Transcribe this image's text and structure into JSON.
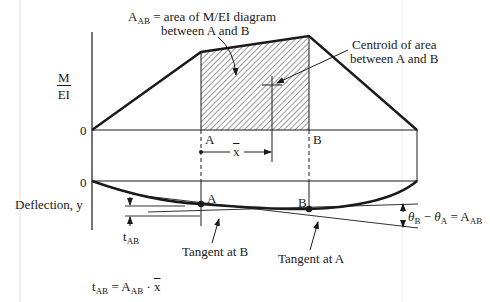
{
  "diagram": {
    "labels": {
      "area_label_main": "A",
      "area_label_sub": "AB",
      "area_label_rest": " = area of M/EI diagram",
      "area_label_line2": "between A and B",
      "centroid_line1": "Centroid of area",
      "centroid_line2": "between A and B",
      "m_ei_num": "M",
      "m_ei_den": "EI",
      "zero_top": "0",
      "zero_bottom": "0",
      "point_a_top": "A",
      "point_b_top": "B",
      "xbar": "x",
      "deflection_axis": "Deflection, y",
      "point_a_curve": "A",
      "point_b_curve": "B",
      "t_ab_main": "t",
      "t_ab_sub": "AB",
      "tangent_at_b": "Tangent at B",
      "tangent_at_a": "Tangent at A",
      "theta_b": "θ",
      "theta_b_sub": "B",
      "theta_minus": " − ",
      "theta_a": "θ",
      "theta_a_sub": "A",
      "theta_eq": " = A",
      "theta_eq_sub": "AB",
      "formula_t": "t",
      "formula_t_sub": "AB",
      "formula_eq": " = A",
      "formula_a_sub": "AB",
      "formula_dot": " · ",
      "formula_xbar": "x"
    },
    "geometry": {
      "m_ei_diagram": {
        "origin": [
          92,
          130
        ],
        "point_a_peak": [
          201,
          52
        ],
        "point_b_peak": [
          309,
          36
        ],
        "end": [
          417,
          130
        ],
        "baseline_y": 130
      },
      "centroid": [
        272,
        85
      ],
      "deflection_curve": {
        "baseline_y": 181,
        "point_a": [
          201,
          204
        ],
        "point_b": [
          309,
          209
        ],
        "end": [
          417,
          181
        ]
      }
    },
    "colors": {
      "ink": "#1a1a1a",
      "hatch": "#333333",
      "scan_line": "#d8d8d8"
    }
  }
}
